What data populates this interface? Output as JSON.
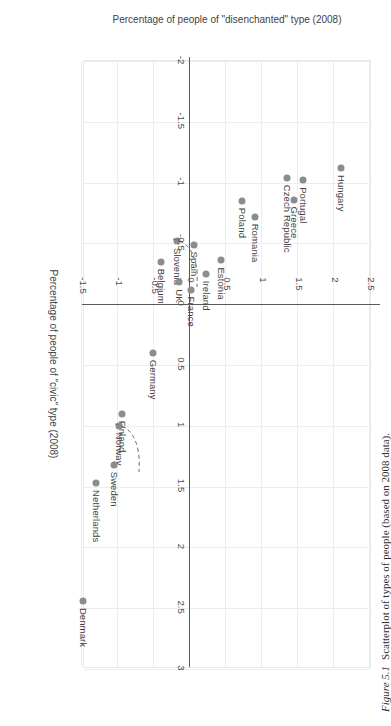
{
  "figure": {
    "caption_label": "Figure 5.1",
    "caption_text": "Scatterplot of types of people (based on 2008 data)."
  },
  "chart_data": {
    "type": "scatter",
    "title": "",
    "xlabel": "Percentage of people of \"civic\" type (2008)",
    "ylabel": "Percentage of people of \"disenchanted\" type (2008)",
    "xlim": [
      -2,
      3
    ],
    "ylim": [
      -1.5,
      2.5
    ],
    "xticks": [
      -2,
      -1.5,
      -1,
      -0.5,
      0,
      0.5,
      1,
      1.5,
      2,
      2.5,
      3
    ],
    "yticks": [
      -1.5,
      -1,
      -0.5,
      0,
      0.5,
      1,
      1.5,
      2,
      2.5
    ],
    "xtick_labels": [
      "-2",
      "-1.5",
      "-1",
      "-0.5",
      "0",
      "0.5",
      "1",
      "1.5",
      "2",
      "2.5",
      "3"
    ],
    "ytick_labels": [
      "-1.5",
      "-1",
      "-0.5",
      "0",
      "0.5",
      "1",
      "1.5",
      "2",
      "2.5"
    ],
    "grid": true,
    "legend": "none",
    "marker_color": "#8c8c8c",
    "points": [
      {
        "label": "Hungary",
        "x": -1.12,
        "y": 2.1,
        "label_pos": "right"
      },
      {
        "label": "Portugal",
        "x": -1.02,
        "y": 1.57,
        "label_pos": "right"
      },
      {
        "label": "Greece",
        "x": -0.86,
        "y": 1.45,
        "label_pos": "right"
      },
      {
        "label": "Czech Republic",
        "x": -1.04,
        "y": 1.35,
        "label_pos": "right"
      },
      {
        "label": "Romania",
        "x": -0.72,
        "y": 0.9,
        "label_pos": "right"
      },
      {
        "label": "Poland",
        "x": -0.85,
        "y": 0.72,
        "label_pos": "right"
      },
      {
        "label": "Estonia",
        "x": -0.36,
        "y": 0.43,
        "label_pos": "right"
      },
      {
        "label": "Ireland",
        "x": -0.25,
        "y": 0.22,
        "label_pos": "right"
      },
      {
        "label": "France",
        "x": -0.12,
        "y": 0.02,
        "label_pos": "right"
      },
      {
        "label": "Spain",
        "x": -0.49,
        "y": 0.05,
        "label_pos": "right"
      },
      {
        "label": "Slovenia",
        "x": -0.52,
        "y": -0.18,
        "label_pos": "right",
        "leader": true
      },
      {
        "label": "UK",
        "x": -0.18,
        "y": -0.15,
        "label_pos": "right"
      },
      {
        "label": "Belgium",
        "x": -0.35,
        "y": -0.4,
        "label_pos": "right"
      },
      {
        "label": "Germany",
        "x": 0.4,
        "y": -0.52,
        "label_pos": "right"
      },
      {
        "label": "Finland",
        "x": 0.9,
        "y": -0.95,
        "label_pos": "right"
      },
      {
        "label": "Norway",
        "x": 1.0,
        "y": -0.98,
        "label_pos": "right",
        "leader": true
      },
      {
        "label": "Sweden",
        "x": 1.32,
        "y": -1.05,
        "label_pos": "right"
      },
      {
        "label": "Netherlands",
        "x": 1.47,
        "y": -1.3,
        "label_pos": "right"
      },
      {
        "label": "Denmark",
        "x": 2.44,
        "y": -1.48,
        "label_pos": "right"
      }
    ]
  }
}
